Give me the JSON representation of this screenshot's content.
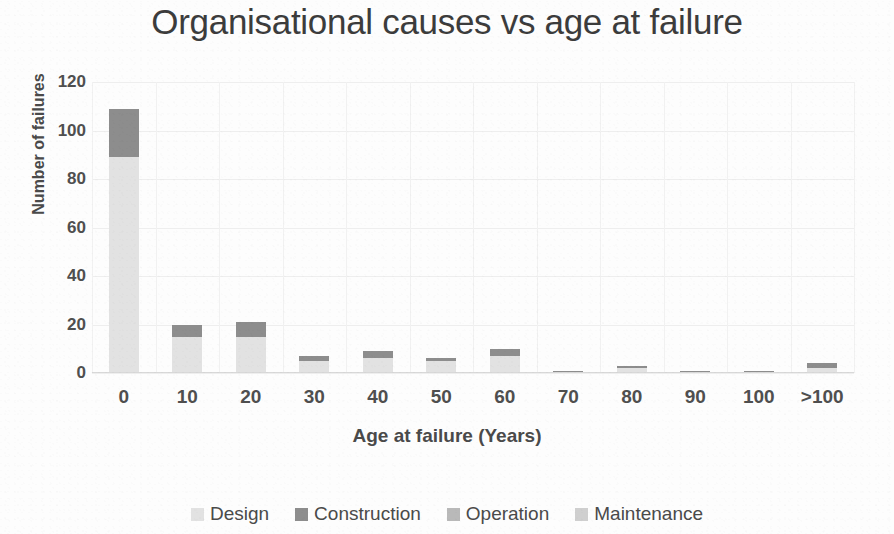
{
  "chart_data": {
    "type": "bar",
    "stacked": true,
    "title": "Organisational causes vs age at failure",
    "xlabel": "Age at failure (Years)",
    "ylabel": "Number of failures",
    "categories": [
      "0",
      "10",
      "20",
      "30",
      "40",
      "50",
      "60",
      "70",
      "80",
      "90",
      "100",
      ">100"
    ],
    "series": [
      {
        "name": "Design",
        "color": "#e2e2e2",
        "values": [
          89,
          15,
          15,
          5,
          6,
          5,
          7,
          0,
          2,
          0,
          0,
          2
        ]
      },
      {
        "name": "Construction",
        "color": "#8d8d8d",
        "values": [
          20,
          5,
          6,
          2,
          3,
          1,
          3,
          1,
          1,
          1,
          1,
          2
        ]
      },
      {
        "name": "Operation",
        "color": "#b9b9b9",
        "values": [
          0,
          0,
          0,
          0,
          0,
          0,
          0,
          0,
          0,
          0,
          0,
          0
        ]
      },
      {
        "name": "Maintenance",
        "color": "#cfcfcf",
        "values": [
          0,
          0,
          0,
          0,
          0,
          0,
          0,
          0,
          0,
          0,
          0,
          0
        ]
      }
    ],
    "totals": [
      109,
      20,
      21,
      7,
      9,
      6,
      10,
      1,
      3,
      1,
      1,
      4
    ],
    "yticks": [
      0,
      20,
      40,
      60,
      80,
      100,
      120
    ],
    "ylim": [
      0,
      120
    ],
    "grid": "both-faint",
    "legend_position": "bottom"
  },
  "legend": {
    "items": [
      {
        "label": "Design",
        "color": "#e2e2e2"
      },
      {
        "label": "Construction",
        "color": "#8d8d8d"
      },
      {
        "label": "Operation",
        "color": "#b9b9b9"
      },
      {
        "label": "Maintenance",
        "color": "#cfcfcf"
      }
    ]
  },
  "colors": {
    "text": "#4a4a4a",
    "title": "#3c3c3c",
    "gridline": "#eeeeee",
    "axis": "#d8d8d8",
    "background": "#fdfdfd"
  }
}
